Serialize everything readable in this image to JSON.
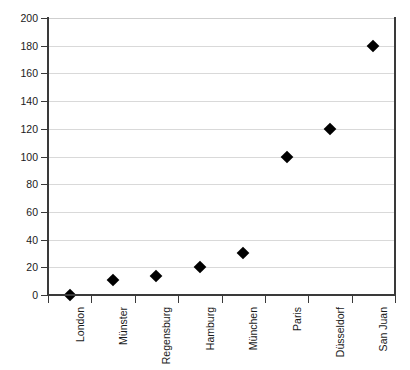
{
  "chart_data": {
    "type": "scatter",
    "title": "",
    "xlabel": "",
    "ylabel": "",
    "categories": [
      "London",
      "Münster",
      "Regensburg",
      "Hamburg",
      "München",
      "Paris",
      "Düsseldorf",
      "San Juan"
    ],
    "values": [
      0,
      11,
      14,
      20,
      30,
      100,
      120,
      180
    ],
    "ylim": [
      0,
      200
    ],
    "ytick_labels": [
      "0",
      "20",
      "40",
      "60",
      "80",
      "100",
      "120",
      "140",
      "160",
      "180",
      "200"
    ],
    "ytick_values": [
      0,
      20,
      40,
      60,
      80,
      100,
      120,
      140,
      160,
      180,
      200
    ],
    "grid": true,
    "legend": false,
    "marker_shape": "diamond",
    "marker_color": "#000000",
    "gridline_color": "#d9d9d9",
    "axis_color": "#3a3a3a",
    "background_color": "#ffffff"
  }
}
